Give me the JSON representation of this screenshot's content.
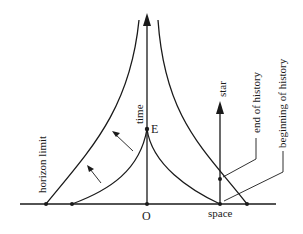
{
  "diagram": {
    "type": "spacetime-horizon-diagram",
    "labels": {
      "time_axis": "time",
      "space_axis": "space",
      "origin": "O",
      "event": "E",
      "star": "star",
      "horizon_limit": "horizon limit",
      "end_of_history": "end of history",
      "beginning_of_history": "beginning of history"
    },
    "colors": {
      "ink": "#1a1a1a",
      "background": "#ffffff"
    }
  }
}
